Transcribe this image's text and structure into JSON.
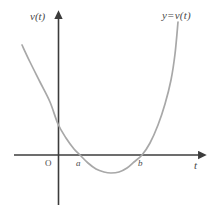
{
  "figure": {
    "title": "",
    "background_color": "#ffffff",
    "axis_color": "#3c3c3c",
    "curve_color": "#a8a8a8",
    "label_color": "#4a4a4a"
  },
  "labels": {
    "y_axis": "v(t)",
    "x_axis": "t",
    "curve": "y=v(t)",
    "origin": "O",
    "root_a": "a",
    "root_b": "b"
  },
  "chart_data": {
    "type": "line",
    "title": "",
    "xlabel": "t",
    "ylabel": "v(t)",
    "grid": false,
    "legend": null,
    "annotations": [
      {
        "text": "y=v(t)",
        "x": 178,
        "y": 22,
        "role": "curve-label"
      },
      {
        "text": "O",
        "x": 58,
        "y": 155,
        "role": "origin"
      },
      {
        "text": "a",
        "x": 80,
        "y": 155,
        "role": "x-intercept"
      },
      {
        "text": "b",
        "x": 142,
        "y": 155,
        "role": "x-intercept"
      }
    ],
    "axes": {
      "x_axis_pixel_y": 155,
      "y_axis_pixel_x": 58,
      "x_axis_from": 14,
      "x_axis_to": 203,
      "y_axis_from": 14,
      "y_axis_to": 205,
      "x_arrow": true,
      "y_arrow": true
    },
    "series": [
      {
        "name": "y=v(t)",
        "shape": "parabola-upward",
        "color": "#a8a8a8",
        "roots_pixel_x": [
          80,
          142
        ],
        "vertex_pixel": [
          111,
          173
        ],
        "y_intercept_pixel": [
          58,
          124
        ],
        "points": [
          [
            22,
            45
          ],
          [
            30,
            62
          ],
          [
            40,
            82
          ],
          [
            50,
            102
          ],
          [
            58,
            124
          ],
          [
            66,
            138
          ],
          [
            74,
            149
          ],
          [
            80,
            155
          ],
          [
            88,
            163
          ],
          [
            96,
            169
          ],
          [
            104,
            172
          ],
          [
            111,
            173
          ],
          [
            119,
            172
          ],
          [
            127,
            168
          ],
          [
            134,
            162
          ],
          [
            142,
            155
          ],
          [
            150,
            143
          ],
          [
            158,
            125
          ],
          [
            165,
            104
          ],
          [
            171,
            80
          ],
          [
            175,
            54
          ],
          [
            178,
            22
          ]
        ]
      }
    ]
  }
}
